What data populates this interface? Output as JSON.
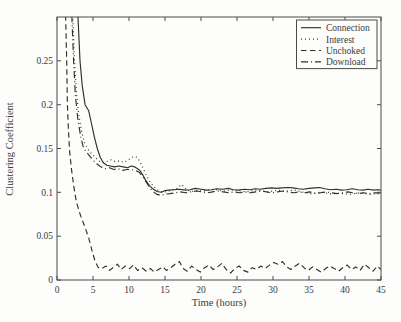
{
  "figure": {
    "background": "#fdfdfb",
    "line_color": "#2f2f2f",
    "axis_color": "#4a4a4a",
    "text_color": "#3b3b3b"
  },
  "chart_data": {
    "type": "line",
    "title": "",
    "xlabel": "Time (hours)",
    "ylabel": "Clustering Coefficient",
    "xlim": [
      0,
      45
    ],
    "ylim": [
      0,
      0.3
    ],
    "x_ticks": [
      0,
      5,
      10,
      15,
      20,
      25,
      30,
      35,
      40,
      45
    ],
    "x_tick_labels": [
      "0",
      "5",
      "10",
      "15",
      "20",
      "25",
      "30",
      "35",
      "40",
      "45"
    ],
    "y_ticks": [
      0,
      0.05,
      0.1,
      0.15,
      0.2,
      0.25
    ],
    "y_tick_labels": [
      "0",
      "0.05",
      "0.1",
      "0.15",
      "0.2",
      "0.25"
    ],
    "grid": false,
    "legend_position": "top-right",
    "series": [
      {
        "name": "Connection",
        "style": "solid",
        "points": [
          [
            2.9,
            0.302
          ],
          [
            3.2,
            0.25
          ],
          [
            3.5,
            0.222
          ],
          [
            3.9,
            0.2
          ],
          [
            4.4,
            0.193
          ],
          [
            4.8,
            0.178
          ],
          [
            5.2,
            0.163
          ],
          [
            5.6,
            0.15
          ],
          [
            6,
            0.14
          ],
          [
            6.4,
            0.134
          ],
          [
            6.9,
            0.131
          ],
          [
            7.4,
            0.13
          ],
          [
            8,
            0.129
          ],
          [
            8.6,
            0.13
          ],
          [
            9.2,
            0.129
          ],
          [
            9.8,
            0.128
          ],
          [
            10.3,
            0.13
          ],
          [
            10.8,
            0.129
          ],
          [
            11.2,
            0.127
          ],
          [
            11.5,
            0.125
          ],
          [
            11.9,
            0.12
          ],
          [
            12.3,
            0.114
          ],
          [
            12.8,
            0.108
          ],
          [
            13.3,
            0.104
          ],
          [
            13.9,
            0.101
          ],
          [
            14.5,
            0.1
          ],
          [
            15,
            0.102
          ],
          [
            15.5,
            0.1025
          ],
          [
            16.2,
            0.103
          ],
          [
            17,
            0.1035
          ],
          [
            17.8,
            0.1025
          ],
          [
            18.5,
            0.103
          ],
          [
            19.2,
            0.1045
          ],
          [
            20,
            0.1035
          ],
          [
            20.8,
            0.1025
          ],
          [
            21.5,
            0.103
          ],
          [
            22.2,
            0.104
          ],
          [
            23,
            0.1035
          ],
          [
            23.8,
            0.1045
          ],
          [
            24.5,
            0.103
          ],
          [
            25.2,
            0.1025
          ],
          [
            26,
            0.1035
          ],
          [
            26.8,
            0.103
          ],
          [
            27.5,
            0.104
          ],
          [
            28.2,
            0.1035
          ],
          [
            29,
            0.1045
          ],
          [
            29.8,
            0.105
          ],
          [
            30.5,
            0.1045
          ],
          [
            31.2,
            0.105
          ],
          [
            32,
            0.1055
          ],
          [
            32.8,
            0.105
          ],
          [
            33.5,
            0.104
          ],
          [
            34.2,
            0.1035
          ],
          [
            35,
            0.1045
          ],
          [
            35.8,
            0.105
          ],
          [
            36.5,
            0.1055
          ],
          [
            37.2,
            0.104
          ],
          [
            38,
            0.103
          ],
          [
            38.8,
            0.1035
          ],
          [
            39.5,
            0.1025
          ],
          [
            40.2,
            0.103
          ],
          [
            41,
            0.104
          ],
          [
            41.8,
            0.103
          ],
          [
            42.5,
            0.1025
          ],
          [
            43.2,
            0.1035
          ],
          [
            44,
            0.1025
          ],
          [
            44.6,
            0.103
          ],
          [
            45,
            0.1025
          ]
        ]
      },
      {
        "name": "Interest",
        "style": "dotted",
        "points": [
          [
            2.2,
            0.302
          ],
          [
            2.4,
            0.255
          ],
          [
            2.7,
            0.215
          ],
          [
            3,
            0.19
          ],
          [
            3.4,
            0.17
          ],
          [
            3.8,
            0.157
          ],
          [
            4.3,
            0.149
          ],
          [
            4.8,
            0.144
          ],
          [
            5.3,
            0.14
          ],
          [
            5.8,
            0.136
          ],
          [
            6.3,
            0.134
          ],
          [
            6.9,
            0.135
          ],
          [
            7.5,
            0.137
          ],
          [
            8.1,
            0.135
          ],
          [
            8.7,
            0.136
          ],
          [
            9.3,
            0.134
          ],
          [
            9.9,
            0.137
          ],
          [
            10.4,
            0.14
          ],
          [
            10.9,
            0.141
          ],
          [
            11.3,
            0.138
          ],
          [
            11.7,
            0.132
          ],
          [
            12.1,
            0.125
          ],
          [
            12.5,
            0.118
          ],
          [
            13,
            0.111
          ],
          [
            13.5,
            0.106
          ],
          [
            14.1,
            0.102
          ],
          [
            14.7,
            0.1
          ],
          [
            15.3,
            0.101
          ],
          [
            15.9,
            0.1025
          ],
          [
            16.6,
            0.104
          ],
          [
            17.3,
            0.109
          ],
          [
            18,
            0.103
          ],
          [
            18.7,
            0.101
          ],
          [
            19.5,
            0.102
          ],
          [
            20.3,
            0.1015
          ],
          [
            21,
            0.1025
          ],
          [
            21.8,
            0.1035
          ],
          [
            22.5,
            0.1025
          ],
          [
            23.3,
            0.1015
          ],
          [
            24,
            0.1025
          ],
          [
            24.8,
            0.103
          ],
          [
            25.5,
            0.1015
          ],
          [
            26.3,
            0.1005
          ],
          [
            27,
            0.1015
          ],
          [
            27.8,
            0.1025
          ],
          [
            28.5,
            0.1015
          ],
          [
            29.3,
            0.1005
          ],
          [
            30,
            0.1015
          ],
          [
            30.8,
            0.1025
          ],
          [
            31.5,
            0.101
          ],
          [
            32.3,
            0.102
          ],
          [
            33,
            0.1025
          ],
          [
            33.8,
            0.101
          ],
          [
            34.5,
            0.0995
          ],
          [
            35.3,
            0.0985
          ],
          [
            36,
            0.0995
          ],
          [
            36.8,
            0.1005
          ],
          [
            37.5,
            0.099
          ],
          [
            38.3,
            0.098
          ],
          [
            39,
            0.099
          ],
          [
            39.8,
            0.0985
          ],
          [
            40.5,
            0.0975
          ],
          [
            41.3,
            0.0985
          ],
          [
            42,
            0.0995
          ],
          [
            42.8,
            0.0985
          ],
          [
            43.5,
            0.0975
          ],
          [
            44.3,
            0.0985
          ],
          [
            45,
            0.098
          ]
        ]
      },
      {
        "name": "Unchoked",
        "style": "dashed",
        "points": [
          [
            1.2,
            0.302
          ],
          [
            1.35,
            0.25
          ],
          [
            1.45,
            0.2
          ],
          [
            1.6,
            0.17
          ],
          [
            1.75,
            0.147
          ],
          [
            2,
            0.127
          ],
          [
            2.35,
            0.106
          ],
          [
            2.7,
            0.089
          ],
          [
            3.25,
            0.074
          ],
          [
            3.85,
            0.061
          ],
          [
            4.4,
            0.048
          ],
          [
            4.85,
            0.034
          ],
          [
            5.3,
            0.021
          ],
          [
            5.75,
            0.014
          ],
          [
            6.2,
            0.013
          ],
          [
            6.8,
            0.016
          ],
          [
            7.3,
            0.011
          ],
          [
            7.9,
            0.015
          ],
          [
            8.4,
            0.018
          ],
          [
            8.9,
            0.012
          ],
          [
            9.5,
            0.016
          ],
          [
            10.1,
            0.013
          ],
          [
            10.6,
            0.017
          ],
          [
            11.2,
            0.011
          ],
          [
            11.8,
            0.014
          ],
          [
            12.4,
            0.01
          ],
          [
            13,
            0.013
          ],
          [
            13.5,
            0.009
          ],
          [
            14.1,
            0.012
          ],
          [
            14.7,
            0.015
          ],
          [
            15.2,
            0.011
          ],
          [
            15.8,
            0.014
          ],
          [
            16.4,
            0.018
          ],
          [
            17,
            0.021
          ],
          [
            17.5,
            0.013
          ],
          [
            18.1,
            0.01
          ],
          [
            18.7,
            0.016
          ],
          [
            19.3,
            0.012
          ],
          [
            19.9,
            0.009
          ],
          [
            20.5,
            0.014
          ],
          [
            21.1,
            0.017
          ],
          [
            21.7,
            0.012
          ],
          [
            22.3,
            0.015
          ],
          [
            22.9,
            0.019
          ],
          [
            23.5,
            0.012
          ],
          [
            24.1,
            0.008
          ],
          [
            24.7,
            0.013
          ],
          [
            25.3,
            0.016
          ],
          [
            25.9,
            0.011
          ],
          [
            26.5,
            0.009
          ],
          [
            27.1,
            0.014
          ],
          [
            27.7,
            0.012
          ],
          [
            28.3,
            0.016
          ],
          [
            28.9,
            0.013
          ],
          [
            29.5,
            0.017
          ],
          [
            30.1,
            0.02
          ],
          [
            30.7,
            0.018
          ],
          [
            31.3,
            0.021
          ],
          [
            31.9,
            0.015
          ],
          [
            32.5,
            0.012
          ],
          [
            33.1,
            0.016
          ],
          [
            33.7,
            0.019
          ],
          [
            34.3,
            0.014
          ],
          [
            34.9,
            0.011
          ],
          [
            35.5,
            0.015
          ],
          [
            36.1,
            0.012
          ],
          [
            36.7,
            0.009
          ],
          [
            37.3,
            0.013
          ],
          [
            37.9,
            0.016
          ],
          [
            38.5,
            0.013
          ],
          [
            39.1,
            0.01
          ],
          [
            39.7,
            0.014
          ],
          [
            40.3,
            0.017
          ],
          [
            40.9,
            0.012
          ],
          [
            41.5,
            0.015
          ],
          [
            42.1,
            0.011
          ],
          [
            42.7,
            0.018
          ],
          [
            43.3,
            0.014
          ],
          [
            43.9,
            0.01
          ],
          [
            44.5,
            0.016
          ],
          [
            45,
            0.012
          ]
        ]
      },
      {
        "name": "Download",
        "style": "dashdot",
        "points": [
          [
            2.05,
            0.302
          ],
          [
            2.3,
            0.25
          ],
          [
            2.55,
            0.21
          ],
          [
            2.9,
            0.183
          ],
          [
            3.3,
            0.163
          ],
          [
            3.7,
            0.15
          ],
          [
            4.2,
            0.145
          ],
          [
            4.7,
            0.14
          ],
          [
            5.1,
            0.136
          ],
          [
            5.6,
            0.132
          ],
          [
            6.1,
            0.129
          ],
          [
            6.7,
            0.127
          ],
          [
            7.3,
            0.128
          ],
          [
            7.9,
            0.126
          ],
          [
            8.5,
            0.127
          ],
          [
            9.1,
            0.125
          ],
          [
            9.7,
            0.126
          ],
          [
            10.3,
            0.126
          ],
          [
            10.9,
            0.125
          ],
          [
            11.4,
            0.123
          ],
          [
            11.8,
            0.119
          ],
          [
            12.2,
            0.114
          ],
          [
            12.7,
            0.108
          ],
          [
            13.2,
            0.102
          ],
          [
            13.8,
            0.098
          ],
          [
            14.4,
            0.0965
          ],
          [
            15,
            0.098
          ],
          [
            15.7,
            0.0985
          ],
          [
            16.4,
            0.0995
          ],
          [
            17.1,
            0.1005
          ],
          [
            17.9,
            0.0995
          ],
          [
            18.6,
            0.1005
          ],
          [
            19.4,
            0.1015
          ],
          [
            20.1,
            0.1005
          ],
          [
            20.9,
            0.0995
          ],
          [
            21.6,
            0.1005
          ],
          [
            22.4,
            0.1015
          ],
          [
            23.1,
            0.1005
          ],
          [
            23.9,
            0.0995
          ],
          [
            24.6,
            0.1005
          ],
          [
            25.4,
            0.0995
          ],
          [
            26.1,
            0.1005
          ],
          [
            26.9,
            0.0995
          ],
          [
            27.6,
            0.1005
          ],
          [
            28.4,
            0.1015
          ],
          [
            29.1,
            0.1005
          ],
          [
            29.9,
            0.0995
          ],
          [
            30.6,
            0.1005
          ],
          [
            31.4,
            0.1015
          ],
          [
            32.1,
            0.1005
          ],
          [
            32.9,
            0.0995
          ],
          [
            33.6,
            0.1005
          ],
          [
            34.4,
            0.0995
          ],
          [
            35.1,
            0.1005
          ],
          [
            35.9,
            0.0985
          ],
          [
            36.6,
            0.0995
          ],
          [
            37.4,
            0.1005
          ],
          [
            38.1,
            0.0995
          ],
          [
            38.9,
            0.0985
          ],
          [
            39.6,
            0.0995
          ],
          [
            40.4,
            0.1005
          ],
          [
            41.1,
            0.0995
          ],
          [
            41.9,
            0.0985
          ],
          [
            42.6,
            0.0995
          ],
          [
            43.4,
            0.0985
          ],
          [
            44.1,
            0.0995
          ],
          [
            45,
            0.0995
          ]
        ]
      }
    ]
  }
}
